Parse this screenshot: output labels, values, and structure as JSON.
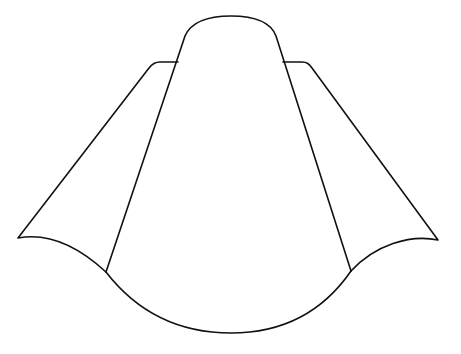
{
  "figure": {
    "background": "#ffffff",
    "stroke_color": "#111111",
    "stroke_width": 1.6,
    "parts": [
      {
        "name": "central-dome",
        "label": "Central dome outline"
      },
      {
        "name": "left-flap",
        "label": "Left flap"
      },
      {
        "name": "right-flap",
        "label": "Right flap"
      },
      {
        "name": "bottom-arc",
        "label": "Bottom arc"
      }
    ]
  }
}
